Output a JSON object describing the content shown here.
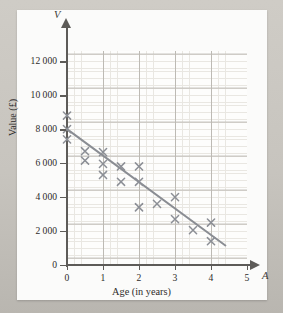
{
  "chart_data": {
    "type": "scatter",
    "title": "",
    "xlabel": "Age (in years)",
    "ylabel": "Value (£)",
    "x_axis_symbol": "A",
    "y_axis_symbol": "V",
    "xlim": [
      0,
      5
    ],
    "ylim": [
      0,
      12600
    ],
    "xticks": [
      0,
      1,
      2,
      3,
      4,
      5
    ],
    "xtick_labels": [
      "0",
      "1",
      "2",
      "3",
      "4",
      "5"
    ],
    "yticks": [
      0,
      2000,
      4000,
      6000,
      8000,
      10000,
      12000
    ],
    "ytick_labels": [
      "0",
      "2000",
      "4000",
      "6000",
      "8000",
      "10000",
      "12000"
    ],
    "grid": true,
    "grid_major_x": 1,
    "grid_major_y": 2000,
    "grid_minor_x": 0.2,
    "grid_minor_y": 400,
    "legend": null,
    "marker": "x",
    "marker_color": "#8c8f96",
    "points": [
      {
        "x": 0,
        "y": 8800
      },
      {
        "x": 0,
        "y": 8000
      },
      {
        "x": 0,
        "y": 7400
      },
      {
        "x": 0.5,
        "y": 6700
      },
      {
        "x": 0.5,
        "y": 6150
      },
      {
        "x": 1,
        "y": 6650
      },
      {
        "x": 1,
        "y": 5950
      },
      {
        "x": 1,
        "y": 5300
      },
      {
        "x": 1.5,
        "y": 5800
      },
      {
        "x": 1.5,
        "y": 4900
      },
      {
        "x": 2,
        "y": 5800
      },
      {
        "x": 2,
        "y": 4900
      },
      {
        "x": 2,
        "y": 3400
      },
      {
        "x": 2.5,
        "y": 3600
      },
      {
        "x": 3,
        "y": 4000
      },
      {
        "x": 3,
        "y": 2700
      },
      {
        "x": 3.5,
        "y": 2050
      },
      {
        "x": 4,
        "y": 2500
      },
      {
        "x": 4,
        "y": 1400
      }
    ],
    "trend_line": {
      "name": "line of best fit",
      "color": "#8a8d93",
      "x0": 0,
      "y0": 8000,
      "x1": 4.4,
      "y1": 1150
    }
  }
}
